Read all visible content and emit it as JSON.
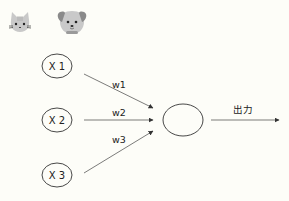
{
  "icons": [
    {
      "name": "cat-face-icon",
      "kind": "cat"
    },
    {
      "name": "dog-face-icon",
      "kind": "dog"
    }
  ],
  "inputs": [
    {
      "label": "X 1"
    },
    {
      "label": "X 2"
    },
    {
      "label": "X 3"
    }
  ],
  "weights": [
    {
      "label": "w1"
    },
    {
      "label": "w2"
    },
    {
      "label": "w3"
    }
  ],
  "output": {
    "label": "出力"
  },
  "colors": {
    "background": "#fdfdf8",
    "stroke": "#333333",
    "icon_fill": "#c8c8c8",
    "icon_dark": "#7a7a7a"
  }
}
